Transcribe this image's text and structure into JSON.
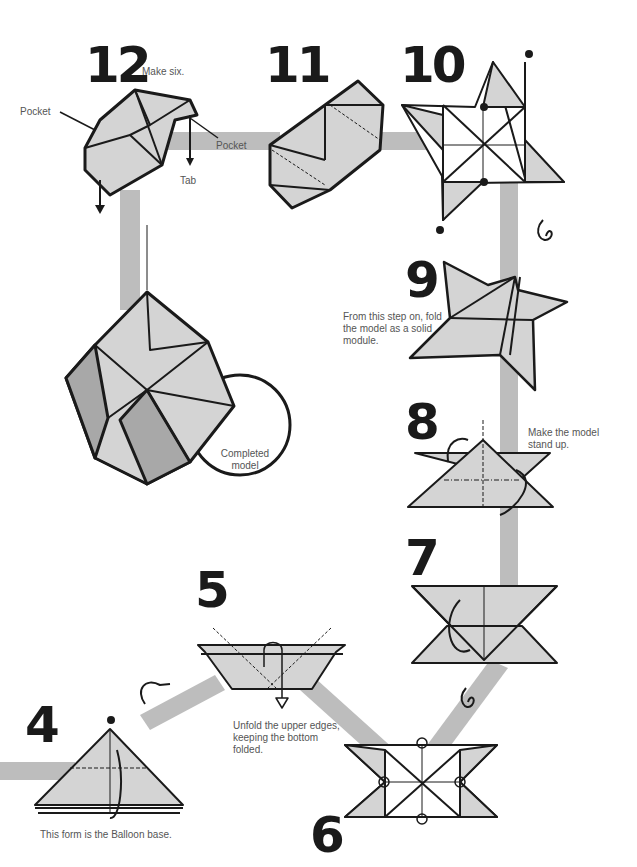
{
  "colors": {
    "path": "#bdbdbd",
    "paper": "#d4d4d4",
    "paper_dark": "#a8a8a8",
    "ink": "#1a1a1a",
    "text": "#555555"
  },
  "steps": [
    {
      "number": "12",
      "note": "Make six.",
      "labels": {
        "pocket_left": "Pocket",
        "pocket_right": "Pocket",
        "tab": "Tab"
      }
    },
    {
      "number": "11"
    },
    {
      "number": "10"
    },
    {
      "number": "9",
      "note": "From this step on, fold the model as a solid module."
    },
    {
      "number": "8",
      "note": "Make the model stand up."
    },
    {
      "number": "7"
    },
    {
      "number": "6"
    },
    {
      "number": "5",
      "note": "Unfold the upper edges, keeping the bottom folded."
    },
    {
      "number": "4",
      "note": "This form is the Balloon base."
    }
  ],
  "completed": {
    "label": "Completed model"
  }
}
